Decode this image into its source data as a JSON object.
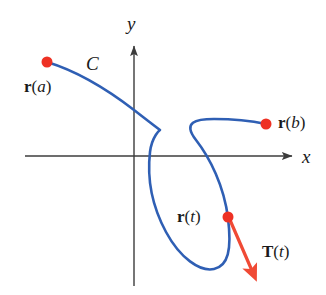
{
  "figure": {
    "background": "#ffffff",
    "width": 326,
    "height": 295
  },
  "colors": {
    "curve": "#2f5fb4",
    "point": "#ee3124",
    "vector": "#f04a35",
    "axis": "#3c3c3c",
    "text": "#1a1a1a"
  },
  "axes": {
    "x_label": "x",
    "y_label": "y",
    "origin": {
      "x": 134,
      "y": 156
    },
    "x_axis": {
      "x1": 25,
      "y1": 156,
      "x2": 292,
      "y2": 156
    },
    "y_axis": {
      "x1": 134,
      "y1": 286,
      "x2": 134,
      "y2": 46
    },
    "x_label_pos": {
      "x": 302,
      "y": 147
    },
    "y_label_pos": {
      "x": 127,
      "y": 14
    }
  },
  "curve": {
    "name_label": "C",
    "name_label_pos": {
      "x": 86,
      "y": 54
    },
    "path": "M 47,62 C 80,72 108,90 134,110 C 152,124 160,130 160,130 C 160,130 152,136 150,152 C 147,178 152,206 166,232 C 180,258 200,272 214,269 C 228,266 232,250 228,218 C 224,186 210,158 196,140 C 182,122 196,119 214,119 C 232,119 252,121 266,124"
  },
  "points": [
    {
      "id": "point-a",
      "label": "r(a)",
      "label_bold": "r",
      "label_italic": "a",
      "cx": 47,
      "cy": 62,
      "r": 5.5,
      "label_pos": {
        "x": 24,
        "y": 78
      }
    },
    {
      "id": "point-b",
      "label": "r(b)",
      "label_bold": "r",
      "label_italic": "b",
      "cx": 266,
      "cy": 124,
      "r": 5.5,
      "label_pos": {
        "x": 278,
        "y": 114
      }
    },
    {
      "id": "point-t",
      "label": "r(t)",
      "label_bold": "r",
      "label_italic": "t",
      "cx": 228,
      "cy": 217,
      "r": 5.5,
      "label_pos": {
        "x": 177,
        "y": 208
      }
    }
  ],
  "tangent_vector": {
    "label": "T(t)",
    "label_bold": "T",
    "label_italic": "t",
    "from": {
      "x": 230,
      "y": 220
    },
    "to": {
      "x": 253,
      "y": 273
    },
    "label_pos": {
      "x": 262,
      "y": 243
    }
  }
}
